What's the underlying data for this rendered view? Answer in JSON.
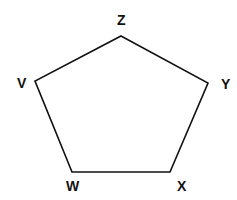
{
  "diagram": {
    "type": "pentagon",
    "stroke_color": "#111111",
    "background": "#ffffff",
    "vertices": [
      {
        "name": "Z",
        "label": "Z",
        "x": 121,
        "y": 36,
        "label_x": 117,
        "label_y": 25
      },
      {
        "name": "Y",
        "label": "Y",
        "x": 208,
        "y": 83,
        "label_x": 221,
        "label_y": 89
      },
      {
        "name": "X",
        "label": "X",
        "x": 170,
        "y": 172,
        "label_x": 177,
        "label_y": 191
      },
      {
        "name": "W",
        "label": "W",
        "x": 72,
        "y": 172,
        "label_x": 66,
        "label_y": 191
      },
      {
        "name": "V",
        "label": "V",
        "x": 35,
        "y": 81,
        "label_x": 17,
        "label_y": 88
      }
    ],
    "edges": [
      [
        "Z",
        "Y"
      ],
      [
        "Y",
        "X"
      ],
      [
        "X",
        "W"
      ],
      [
        "W",
        "V"
      ],
      [
        "V",
        "Z"
      ]
    ]
  }
}
